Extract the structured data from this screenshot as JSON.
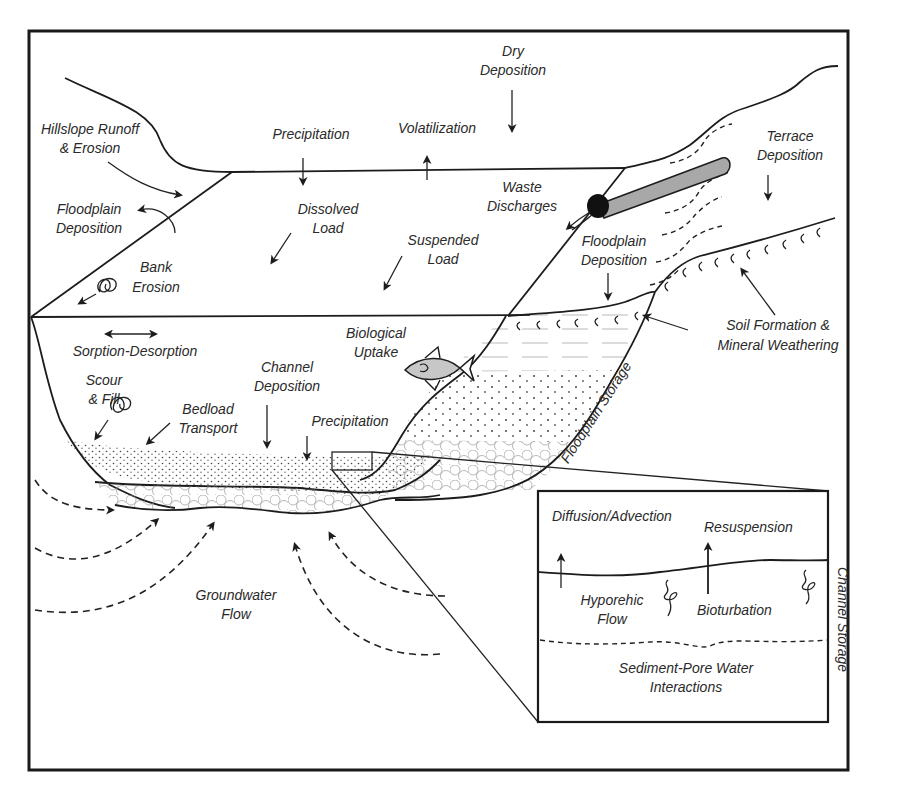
{
  "figure": {
    "type": "conceptual river-floodplain contaminant transport diagram",
    "colors": {
      "line": "#1c1c1c",
      "text": "#2a2a2a",
      "pipe_fill": "#a8a8a8",
      "background": "#ffffff"
    }
  },
  "labels": {
    "hillslope_runoff": [
      "Hillslope Runoff",
      "& Erosion"
    ],
    "floodplain_deposition_left": [
      "Floodplain",
      "Deposition"
    ],
    "bank_erosion": [
      "Bank",
      "Erosion"
    ],
    "precipitation_top": "Precipitation",
    "volatilization": "Volatilization",
    "dry_deposition": [
      "Dry",
      "Deposition"
    ],
    "dissolved_load": [
      "Dissolved",
      "Load"
    ],
    "suspended_load": [
      "Suspended",
      "Load"
    ],
    "waste_discharges": [
      "Waste",
      "Discharges"
    ],
    "terrace_deposition": [
      "Terrace",
      "Deposition"
    ],
    "floodplain_deposition_right": [
      "Floodplain",
      "Deposition"
    ],
    "soil_formation": [
      "Soil Formation &",
      "Mineral Weathering"
    ],
    "sorption_desorption": "Sorption-Desorption",
    "biological_uptake": [
      "Biological",
      "Uptake"
    ],
    "scour_fill": [
      "Scour",
      "& Fill"
    ],
    "channel_deposition": [
      "Channel",
      "Deposition"
    ],
    "bedload_transport": [
      "Bedload",
      "Transport"
    ],
    "precipitation_channel": "Precipitation",
    "floodplain_storage": "Floodplain  Storage",
    "groundwater_flow": [
      "Groundwater",
      "Flow"
    ]
  },
  "inset": {
    "title_vertical": "Channel Storage",
    "diffusion_advection": "Diffusion/Advection",
    "resuspension": "Resuspension",
    "hyporheic_flow": [
      "Hyporehic",
      "Flow"
    ],
    "bioturbation": "Bioturbation",
    "sediment_pore_water": [
      "Sediment-Pore Water",
      "Interactions"
    ]
  },
  "icons": {
    "fish": "fish-icon",
    "pipe": "waste-pipe-icon",
    "eddy": "scour-eddy-icon",
    "worm": "bioturbation-worm-icon",
    "roots": "soil-root-icon"
  }
}
